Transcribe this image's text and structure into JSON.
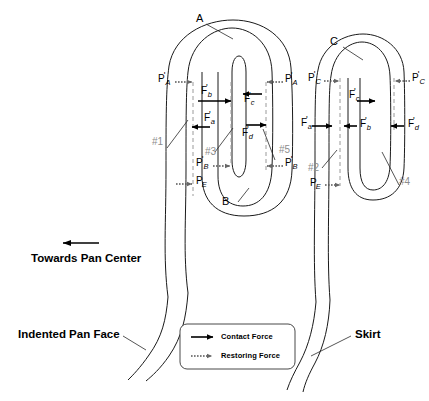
{
  "diagram": {
    "colors": {
      "outline": "#1a1a1a",
      "dashed_restoring": "#9a9a9a",
      "reference_label": "#8c8c8c",
      "background": "#ffffff"
    },
    "callouts": [
      {
        "id": "A",
        "label": "A"
      },
      {
        "id": "B",
        "label": "B"
      },
      {
        "id": "C",
        "label": "C"
      }
    ],
    "reference_numbers": [
      {
        "id": "ref1",
        "label": "#1"
      },
      {
        "id": "ref2",
        "label": "#2"
      },
      {
        "id": "ref3",
        "label": "#3"
      },
      {
        "id": "ref4",
        "label": "#4"
      },
      {
        "id": "ref5",
        "label": "#5"
      }
    ],
    "left_structure": {
      "name": "indented-pan-face-fold",
      "restoring_forces": [
        {
          "id": "left-PA-left",
          "base": "P",
          "sub": "A",
          "prime": "'"
        },
        {
          "id": "left-PA-right",
          "base": "P",
          "sub": "A",
          "prime": "'"
        },
        {
          "id": "left-PB-left",
          "base": "P",
          "sub": "B",
          "prime": "'"
        },
        {
          "id": "left-PB-right",
          "base": "P",
          "sub": "B",
          "prime": "'"
        },
        {
          "id": "left-PE",
          "base": "P",
          "sub": "E",
          "prime": ""
        }
      ],
      "contact_forces": [
        {
          "id": "left-Fb",
          "base": "F",
          "sub": "b",
          "prime": "'"
        },
        {
          "id": "left-Fc",
          "base": "F",
          "sub": "c",
          "prime": "'"
        },
        {
          "id": "left-Fa",
          "base": "F",
          "sub": "a",
          "prime": "'"
        },
        {
          "id": "left-Fd",
          "base": "F",
          "sub": "d",
          "prime": "'"
        }
      ]
    },
    "right_structure": {
      "name": "skirt-fold",
      "restoring_forces": [
        {
          "id": "right-PC-left",
          "base": "P",
          "sub": "C",
          "prime": "'"
        },
        {
          "id": "right-PC-right",
          "base": "P",
          "sub": "C",
          "prime": "'"
        },
        {
          "id": "right-PE",
          "base": "P",
          "sub": "E",
          "prime": ""
        }
      ],
      "contact_forces": [
        {
          "id": "right-Fc",
          "base": "F",
          "sub": "c",
          "prime": "'"
        },
        {
          "id": "right-Fa",
          "base": "F",
          "sub": "a",
          "prime": "'"
        },
        {
          "id": "right-Fb",
          "base": "F",
          "sub": "b",
          "prime": "'"
        },
        {
          "id": "right-Fd",
          "base": "F",
          "sub": "d",
          "prime": "'"
        }
      ]
    },
    "annotations": {
      "direction_label": "Towards Pan Center",
      "indented_pan_face": "Indented Pan Face",
      "skirt": "Skirt"
    },
    "legend": {
      "items": [
        {
          "id": "contact-force",
          "label": "Contact Force",
          "style": "solid-arrow"
        },
        {
          "id": "restoring-force",
          "label": "Restoring Force",
          "style": "dotted-arrow"
        }
      ]
    }
  }
}
